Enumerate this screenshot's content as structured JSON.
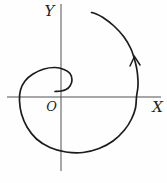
{
  "figure": {
    "background_color": "#fefefe",
    "curve_color": "#1c1c1c",
    "axis_color": "#3f3f3f",
    "labels": {
      "y_axis": "Y",
      "x_axis": "X",
      "origin": "O"
    },
    "axes": {
      "x_line": {
        "x1": 7,
        "y1": 97,
        "x2": 161,
        "y2": 97
      },
      "y_line": {
        "x1": 61,
        "y1": 4,
        "x2": 61,
        "y2": 171
      }
    },
    "curve": {
      "type": "spiral",
      "winding": "counterclockwise",
      "stroke_width": 1.7,
      "points": [
        [
          55,
          91.5
        ],
        [
          61,
          91
        ],
        [
          66,
          89.5
        ],
        [
          70,
          86
        ],
        [
          72,
          80
        ],
        [
          70,
          73.5
        ],
        [
          64,
          69.5
        ],
        [
          55,
          67.5
        ],
        [
          44,
          69
        ],
        [
          33,
          74
        ],
        [
          25,
          81
        ],
        [
          20.5,
          90
        ],
        [
          19.5,
          101
        ],
        [
          21.5,
          114
        ],
        [
          27,
          127
        ],
        [
          36.5,
          139
        ],
        [
          50,
          147.5
        ],
        [
          66,
          152
        ],
        [
          83,
          152.5
        ],
        [
          99,
          148.5
        ],
        [
          113,
          141
        ],
        [
          124.5,
          130
        ],
        [
          131.5,
          119
        ],
        [
          135.5,
          108
        ],
        [
          136.5,
          97
        ],
        [
          138,
          86
        ],
        [
          137.5,
          74
        ],
        [
          135.5,
          63
        ],
        [
          131,
          49
        ],
        [
          124,
          37
        ],
        [
          114,
          26
        ],
        [
          103,
          17.5
        ],
        [
          95,
          13.5
        ],
        [
          91.5,
          12.5
        ]
      ],
      "arrowhead": {
        "apex": [
          134.5,
          56.5
        ],
        "left_barb": [
          130,
          66
        ],
        "right_barb": [
          140,
          65
        ]
      }
    }
  }
}
